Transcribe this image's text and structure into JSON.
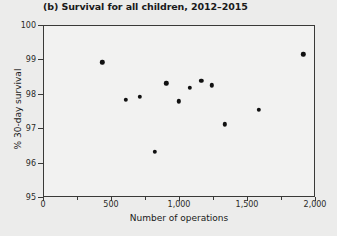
{
  "chart_data": {
    "type": "scatter",
    "title": "(b) Survival for all children, 2012–2015",
    "xlabel": "Number of operations",
    "ylabel": "% 30-day survival",
    "xlim": [
      0,
      2000
    ],
    "ylim": [
      95,
      100
    ],
    "grid": false,
    "legend": null,
    "x_ticks": [
      0,
      500,
      1000,
      1500,
      2000
    ],
    "x_tick_labels": [
      "0",
      "500",
      "1,000",
      "1,500",
      "2,000"
    ],
    "x_minor_ticks": [
      250,
      750,
      1250,
      1750
    ],
    "y_ticks": [
      95,
      96,
      97,
      98,
      99,
      100
    ],
    "y_tick_labels": [
      "95",
      "96",
      "97",
      "98",
      "99",
      "100"
    ],
    "marker": {
      "shape": "circle",
      "color": "#111111",
      "size": 4.4
    },
    "points": [
      {
        "x": 437,
        "y": 98.92
      },
      {
        "x": 610,
        "y": 97.82
      },
      {
        "x": 711,
        "y": 97.92
      },
      {
        "x": 820,
        "y": 96.32
      },
      {
        "x": 906,
        "y": 98.31
      },
      {
        "x": 1000,
        "y": 97.78
      },
      {
        "x": 1078,
        "y": 98.18
      },
      {
        "x": 1164,
        "y": 98.37
      },
      {
        "x": 1242,
        "y": 98.25
      },
      {
        "x": 1336,
        "y": 97.11
      },
      {
        "x": 1586,
        "y": 97.54
      },
      {
        "x": 1915,
        "y": 99.15
      }
    ]
  },
  "colors": {
    "page_background": "#ececeb",
    "plot_background": "#f2f2f1",
    "axis": "#3a3a38",
    "marker": "#111111",
    "text": "#1a1a1a"
  }
}
